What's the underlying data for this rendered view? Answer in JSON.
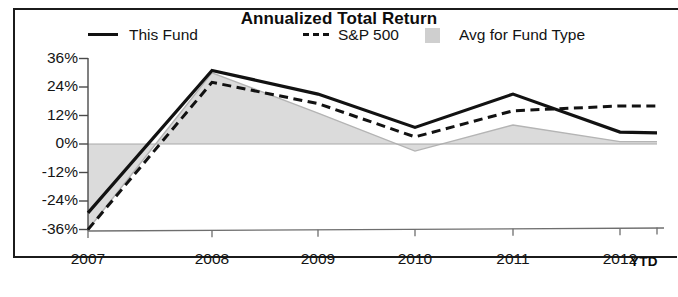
{
  "chart_data": {
    "type": "line",
    "title": "Annualized Total Return",
    "xlabel": "",
    "ylabel": "",
    "grid": false,
    "legend_position": "top",
    "categories": [
      "2007",
      "2008",
      "2009",
      "2010",
      "2011",
      "2012"
    ],
    "x_tick_labels": [
      "2007",
      "2008",
      "2009",
      "2010",
      "2011",
      "2012"
    ],
    "x_axis_suffix_label": "YTD",
    "y_tick_labels": [
      "36%",
      "24%",
      "12%",
      "0%",
      "-12%",
      "-24%",
      "-36%"
    ],
    "y_tick_values": [
      36,
      24,
      12,
      0,
      -12,
      -24,
      -36
    ],
    "ylim": [
      -36,
      36
    ],
    "series": [
      {
        "name": "This Fund",
        "style": "solid",
        "color": "#121212",
        "values": [
          -29,
          31,
          21,
          7,
          21,
          5
        ]
      },
      {
        "name": "S&P 500",
        "style": "dashed",
        "color": "#121212",
        "values": [
          -36,
          26,
          17,
          3,
          14,
          16
        ]
      },
      {
        "name": "Avg for Fund Type",
        "style": "filled-area",
        "color": "#cfcfcf",
        "values": [
          -36,
          30,
          13,
          -3,
          8,
          1
        ]
      }
    ]
  },
  "chart": {
    "title": "Annualized Total Return",
    "legend": [
      {
        "label": "This Fund",
        "marker": "solid-line"
      },
      {
        "label": "S&P 500",
        "marker": "dashed-line"
      },
      {
        "label": "Avg for Fund Type",
        "marker": "gray-swatch"
      }
    ],
    "y_axis": {
      "ticks": [
        "36%",
        "24%",
        "12%",
        "0%",
        "-12%",
        "-24%",
        "-36%"
      ]
    },
    "x_axis": {
      "ticks": [
        "2007",
        "2008",
        "2009",
        "2010",
        "2011",
        "2012"
      ],
      "ytd": "YTD"
    }
  }
}
